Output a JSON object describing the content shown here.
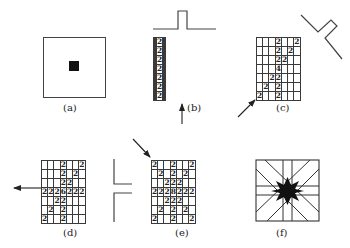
{
  "panels": [
    {
      "id": "a",
      "label": "(a)",
      "description": "Square lattice with single black point source at center"
    },
    {
      "id": "b",
      "label": "(b)",
      "description": "7x7 grid, vertical column of 2s; slit above; arrow from below",
      "grid": [
        [
          "",
          "",
          "",
          "2",
          "",
          "",
          ""
        ],
        [
          "",
          "",
          "",
          "2",
          "",
          "",
          ""
        ],
        [
          "",
          "",
          "",
          "2",
          "",
          "",
          ""
        ],
        [
          "",
          "",
          "",
          "2",
          "",
          "",
          ""
        ],
        [
          "",
          "",
          "",
          "2",
          "",
          "",
          ""
        ],
        [
          "",
          "",
          "",
          "2",
          "",
          "",
          ""
        ],
        [
          "",
          "",
          "",
          "2",
          "",
          "",
          ""
        ]
      ]
    },
    {
      "id": "c",
      "label": "(c)",
      "description": "7x7 grid with vertical and diagonal 2s; angled slit top right; arrow from bottom-left",
      "grid": [
        [
          "",
          "",
          "",
          "2",
          "",
          "",
          "2"
        ],
        [
          "",
          "",
          "",
          "2",
          "",
          "2",
          ""
        ],
        [
          "",
          "",
          "",
          "2",
          "2",
          "",
          ""
        ],
        [
          "",
          "",
          "",
          "4",
          "",
          "",
          ""
        ],
        [
          "",
          "",
          "2",
          "2",
          "",
          "",
          ""
        ],
        [
          "",
          "2",
          "",
          "2",
          "",
          "",
          ""
        ],
        [
          "2",
          "",
          "",
          "2",
          "",
          "",
          ""
        ]
      ]
    },
    {
      "id": "d",
      "label": "(d)",
      "description": "7x7 grid with vertical, diagonal and horizontal 2s, center 6; slit on right; arrow to the left",
      "grid": [
        [
          "",
          "",
          "",
          "2",
          "",
          "",
          "2"
        ],
        [
          "",
          "",
          "",
          "2",
          "",
          "2",
          ""
        ],
        [
          "",
          "",
          "",
          "2",
          "2",
          "",
          ""
        ],
        [
          "2",
          "2",
          "2",
          "6",
          "2",
          "2",
          "2"
        ],
        [
          "",
          "",
          "2",
          "2",
          "",
          "",
          ""
        ],
        [
          "",
          "2",
          "",
          "2",
          "",
          "",
          ""
        ],
        [
          "2",
          "",
          "",
          "2",
          "",
          "",
          ""
        ]
      ]
    },
    {
      "id": "e",
      "label": "(e)",
      "description": "7x7 grid with star pattern of 2s, center 8; arrow from top-left",
      "grid": [
        [
          "2",
          "",
          "",
          "2",
          "",
          "",
          "2"
        ],
        [
          "",
          "2",
          "",
          "2",
          "",
          "2",
          ""
        ],
        [
          "",
          "",
          "2",
          "2",
          "2",
          "",
          ""
        ],
        [
          "2",
          "2",
          "2",
          "8",
          "2",
          "2",
          "2"
        ],
        [
          "",
          "",
          "2",
          "2",
          "2",
          "",
          ""
        ],
        [
          "",
          "2",
          "",
          "2",
          "",
          "2",
          ""
        ],
        [
          "2",
          "",
          "",
          "2",
          "",
          "",
          "2"
        ]
      ]
    },
    {
      "id": "f",
      "label": "(f)",
      "description": "Square with 8-direction rays and black star at center"
    }
  ]
}
